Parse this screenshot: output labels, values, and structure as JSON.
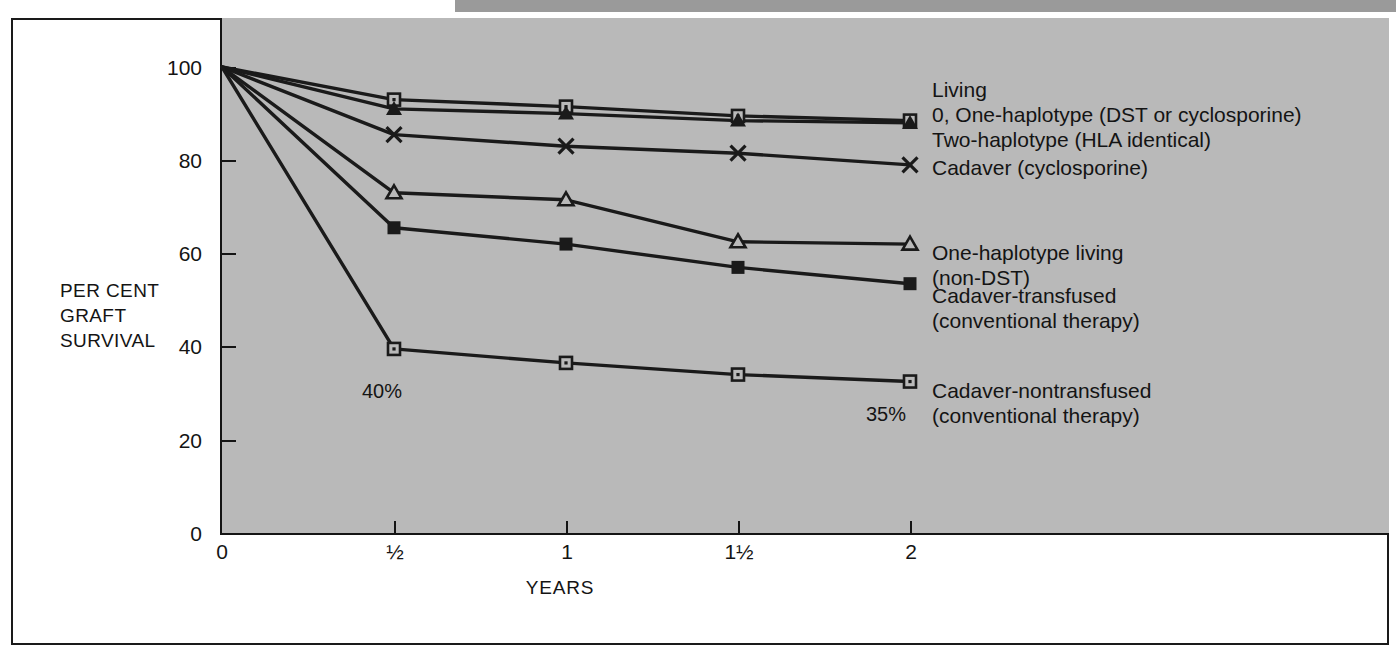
{
  "chart_data": {
    "type": "line",
    "title": "",
    "xlabel": "YEARS",
    "ylabel": "PER CENT GRAFT SURVIVAL",
    "ylabel_lines": [
      "PER CENT",
      "GRAFT",
      "SURVIVAL"
    ],
    "x": [
      0,
      0.5,
      1,
      1.5,
      2
    ],
    "xtick_labels": [
      "0",
      "½",
      "1",
      "1½",
      "2"
    ],
    "ytick_labels": [
      "0",
      "20",
      "40",
      "60",
      "80",
      "100"
    ],
    "ytick_values": [
      0,
      20,
      40,
      60,
      80,
      100
    ],
    "xlim": [
      0,
      2.13
    ],
    "ylim": [
      0,
      110
    ],
    "grid": false,
    "legend_position": "right-of-plot",
    "series": [
      {
        "name": "Living 0, One-haplotype (DST or cyclosporine)",
        "marker": "open-square",
        "values": [
          100,
          93,
          91.5,
          89.5,
          88.5
        ]
      },
      {
        "name": "Two-haplotype (HLA identical)",
        "marker": "filled-triangle",
        "values": [
          100,
          91,
          90,
          88.5,
          88
        ]
      },
      {
        "name": "Cadaver (cyclosporine)",
        "marker": "cross",
        "values": [
          100,
          85.5,
          83,
          81.5,
          79
        ]
      },
      {
        "name": "One-haplotype living (non-DST)",
        "marker": "open-triangle",
        "values": [
          100,
          73,
          71.5,
          62.5,
          62
        ]
      },
      {
        "name": "Cadaver-transfused (conventional therapy)",
        "marker": "filled-square",
        "values": [
          100,
          65.5,
          62,
          57,
          53.5
        ]
      },
      {
        "name": "Cadaver-nontransfused (conventional therapy)",
        "marker": "open-square",
        "values": [
          100,
          39.5,
          36.5,
          34,
          32.5
        ]
      }
    ],
    "annotations": [
      {
        "text": "40%",
        "x": 0.5,
        "y": 39.5
      },
      {
        "text": "35%",
        "x": 2.0,
        "y": 32.5
      }
    ]
  },
  "legend": {
    "entries": [
      {
        "marker": "open-square-and-filled-triangle",
        "lines": [
          "Living",
          "0, One-haplotype (DST or cyclosporine)",
          "Two-haplotype (HLA identical)"
        ]
      },
      {
        "marker": "cross",
        "lines": [
          "Cadaver (cyclosporine)"
        ]
      },
      {
        "marker": "open-triangle",
        "lines": [
          "One-haplotype living",
          "(non-DST)"
        ]
      },
      {
        "marker": "filled-square",
        "lines": [
          "Cadaver-transfused",
          "(conventional therapy)"
        ]
      },
      {
        "marker": "open-square",
        "lines": [
          "Cadaver-nontransfused",
          "(conventional therapy)"
        ]
      }
    ],
    "text_block_1": "Living\n0, One-haplotype (DST or cyclosporine)\nTwo-haplotype (HLA identical)",
    "text_block_2": "Cadaver (cyclosporine)",
    "text_block_3": "One-haplotype living\n(non-DST)",
    "text_block_4": "Cadaver-transfused\n(conventional therapy)",
    "text_block_5": "Cadaver-nontransfused\n(conventional therapy)"
  },
  "axes": {
    "y_title_line1": "PER CENT",
    "y_title_line2": "GRAFT",
    "y_title_line3": "SURVIVAL",
    "x_title": "YEARS",
    "y_ticks": [
      "100",
      "80",
      "60",
      "40",
      "20",
      "0"
    ],
    "x_ticks": [
      "0",
      "½",
      "1",
      "1½",
      "2"
    ]
  },
  "annotations": {
    "pct_40": "40%",
    "pct_35": "35%"
  },
  "colors": {
    "plot_background": "#b9b9b9",
    "page_background": "#ffffff",
    "line": "#1a1a1a",
    "frame": "#1a1a1a",
    "top_band": "#9a9a9a"
  }
}
